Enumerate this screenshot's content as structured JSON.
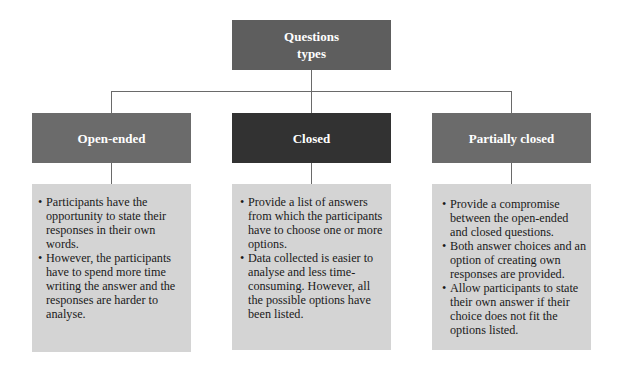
{
  "root": {
    "title_line1": "Questions",
    "title_line2": "types"
  },
  "colors": {
    "root": "#5e5e5e",
    "side_headers": "#6b6b6b",
    "center_header": "#323232",
    "content_bg": "#d4d4d4",
    "connector": "#6a6a6a"
  },
  "categories": [
    {
      "label": "Open-ended",
      "points": [
        "Participants have the opportunity to state their responses in their own words.",
        "However, the participants have to spend more time writing the answer and the responses are harder to analyse."
      ]
    },
    {
      "label": "Closed",
      "points": [
        "Provide a list of answers from which the participants have to choose one or more options.",
        "Data collected is easier to analyse and less time-consuming. However, all the possible options have been listed."
      ]
    },
    {
      "label": "Partially closed",
      "points": [
        "Provide a compromise between the open-ended and closed questions.",
        "Both answer choices and an option of creating own responses are provided.",
        "Allow participants to state their own answer if their choice does not fit the options listed."
      ]
    }
  ]
}
